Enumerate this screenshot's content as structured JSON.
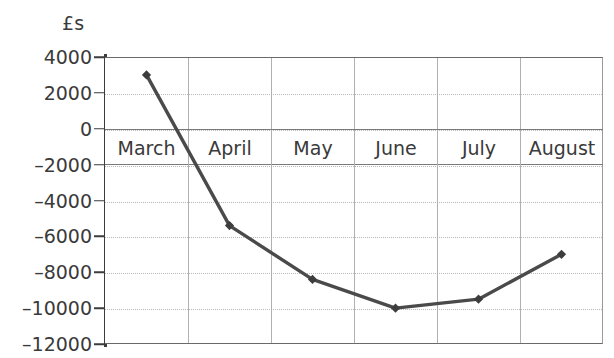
{
  "chart_data": {
    "type": "line",
    "title": "",
    "subtitle": "",
    "xlabel": "",
    "ylabel": "£s",
    "categories": [
      "March",
      "April",
      "May",
      "June",
      "July",
      "August"
    ],
    "values": [
      3000,
      -5400,
      -8400,
      -10000,
      -9500,
      -7000
    ],
    "series": [
      {
        "name": "Cash flow",
        "values": [
          3000,
          -5400,
          -8400,
          -10000,
          -9500,
          -7000
        ]
      }
    ],
    "ylim": [
      -12000,
      4000
    ],
    "y_ticks": [
      4000,
      2000,
      0,
      -2000,
      -4000,
      -6000,
      -8000,
      -10000,
      -12000
    ],
    "y_tick_labels": [
      "4000",
      "2000",
      "0",
      "–2000",
      "–4000",
      "–6000",
      "–8000",
      "–10000",
      "–12000"
    ],
    "grid": true,
    "grid_horizontal": true,
    "grid_vertical": true,
    "legend": false,
    "legend_position": "none",
    "marker": "diamond",
    "line_color": "#4a4a4a",
    "marker_color": "#3d3d3d",
    "grid_color": "#b9b9b9",
    "axis_color": "#3d3d3d",
    "background_color": "#ffffff"
  },
  "axis": {
    "unit_label": "£s"
  }
}
